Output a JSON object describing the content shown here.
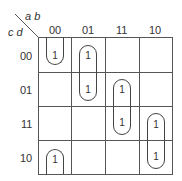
{
  "kmap": {
    "row_var_label": "c d",
    "col_var_label": "a b",
    "col_headers": [
      "00",
      "01",
      "11",
      "10"
    ],
    "row_headers": [
      "00",
      "01",
      "11",
      "10"
    ],
    "cells": [
      [
        "1",
        "1",
        "",
        ""
      ],
      [
        "",
        "1",
        "1",
        ""
      ],
      [
        "",
        "",
        "1",
        "1"
      ],
      [
        "1",
        "",
        "",
        "1"
      ]
    ],
    "groups": [
      {
        "name": "group-c0-wrap",
        "cells": "col 00, rows 00 & 10 (wrap-around)"
      },
      {
        "name": "group-c1",
        "cells": "col 01, rows 00-01"
      },
      {
        "name": "group-c2",
        "cells": "col 11, rows 01-11"
      },
      {
        "name": "group-c3",
        "cells": "col 10, rows 11-10"
      }
    ]
  }
}
